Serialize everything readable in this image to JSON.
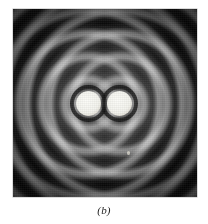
{
  "figure": {
    "caption": "(b)",
    "panel_label": "b",
    "plate": {
      "background_color": "#0a0a0a",
      "bright_color": "#f5f5ef",
      "border_color": "#b8b8b8",
      "left_px": 13,
      "top_px": 9,
      "width_px": 184,
      "height_px": 188
    },
    "sources": [
      {
        "name": "left-source",
        "center_x_px": 76,
        "center_y_px": 95,
        "radius_px": 12
      },
      {
        "name": "right-source",
        "center_x_px": 107,
        "center_y_px": 95,
        "radius_px": 12
      }
    ],
    "artifacts": [
      {
        "name": "emulsion-speck",
        "x_px": 114,
        "y_px": 142
      }
    ]
  },
  "page": {
    "background_color": "#ffffff",
    "text_color": "#1d1d1d"
  }
}
